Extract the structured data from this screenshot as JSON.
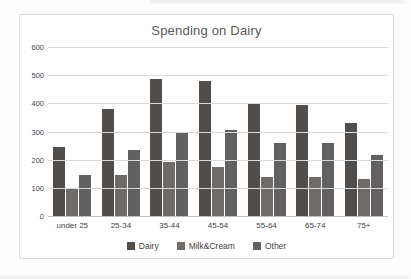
{
  "chart_data": {
    "type": "bar",
    "title": "Spending on Dairy",
    "categories": [
      "under 25",
      "25-34",
      "35-44",
      "45-54",
      "55-64",
      "65-74",
      "75+"
    ],
    "series": [
      {
        "name": "Dairy",
        "color": "#514d4b",
        "values": [
          245,
          380,
          485,
          480,
          400,
          395,
          330
        ]
      },
      {
        "name": "Milk&Cream",
        "color": "#6f6b69",
        "values": [
          95,
          145,
          190,
          175,
          140,
          140,
          130
        ]
      },
      {
        "name": "Other",
        "color": "#626060",
        "values": [
          145,
          235,
          295,
          305,
          260,
          260,
          215
        ]
      }
    ],
    "ylim": [
      0,
      600
    ],
    "ytick_interval": 100,
    "yticks": [
      "600",
      "500",
      "400",
      "300",
      "200",
      "100",
      "0"
    ],
    "grid": true,
    "legend_position": "bottom",
    "colors": {
      "title_text": "#595959",
      "tick_text": "#444444",
      "gridline": "#d9d9d9",
      "axis_line": "#bfbfbf",
      "frame_border": "#d8d8d8",
      "background": "#ffffff"
    }
  }
}
